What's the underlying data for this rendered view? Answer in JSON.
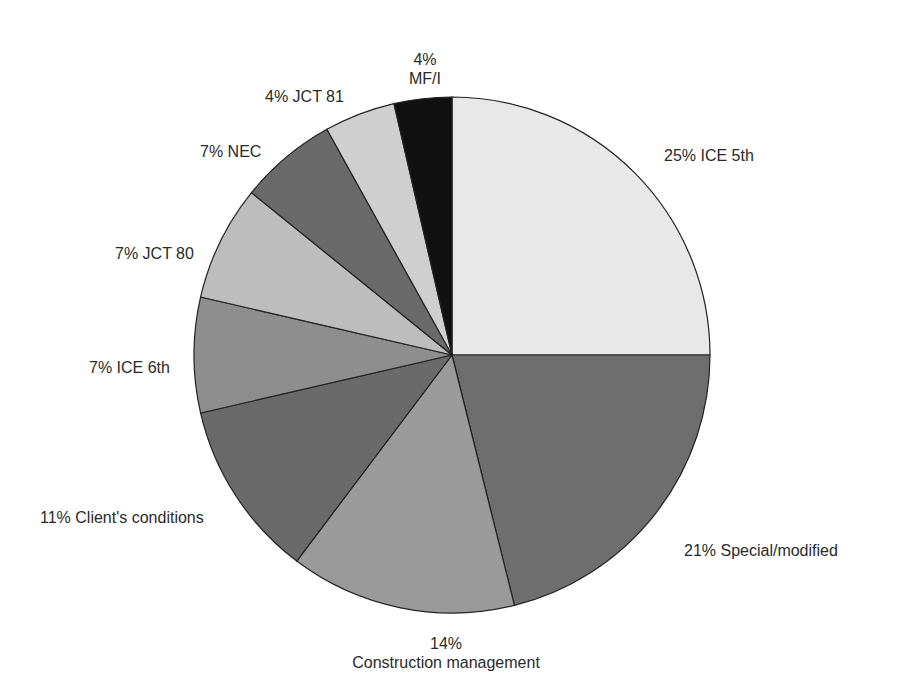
{
  "chart_data": {
    "type": "pie",
    "title": "",
    "start_angle": "12 o'clock",
    "direction": "clockwise",
    "slices": [
      {
        "label": "ICE 5th",
        "value": 25,
        "display": "25% ICE 5th",
        "color": "#e8e8e8",
        "start_deg": 0,
        "end_deg": 90
      },
      {
        "label": "Special/modified",
        "value": 21,
        "display": "21% Special/modified",
        "color": "#6e6e6e",
        "start_deg": 90,
        "end_deg": 166
      },
      {
        "label": "Construction management",
        "value": 14,
        "display": "14%\nConstruction management",
        "color": "#9a9a9a",
        "start_deg": 166,
        "end_deg": 217
      },
      {
        "label": "Client's conditions",
        "value": 11,
        "display": "11% Client's conditions",
        "color": "#6a6a6a",
        "start_deg": 217,
        "end_deg": 257
      },
      {
        "label": "ICE 6th",
        "value": 7,
        "display": "7% ICE 6th",
        "color": "#8e8e8e",
        "start_deg": 257,
        "end_deg": 283
      },
      {
        "label": "JCT 80",
        "value": 7,
        "display": "7% JCT 80",
        "color": "#bdbdbd",
        "start_deg": 283,
        "end_deg": 309
      },
      {
        "label": "NEC",
        "value": 7,
        "display": "7% NEC",
        "color": "#6a6a6a",
        "start_deg": 309,
        "end_deg": 331
      },
      {
        "label": "JCT 81",
        "value": 4,
        "display": "4% JCT 81",
        "color": "#cfcfcf",
        "start_deg": 331,
        "end_deg": 347
      },
      {
        "label": "MF/I",
        "value": 4,
        "display": "4%\nMF/I",
        "color": "#111111",
        "start_deg": 347,
        "end_deg": 360
      }
    ]
  },
  "labels": {
    "ice5": "25% ICE 5th",
    "special": "21% Special/modified",
    "cm_pct": "14%",
    "cm_name": "Construction management",
    "client": "11% Client's conditions",
    "ice6": "7% ICE 6th",
    "jct80": "7% JCT 80",
    "nec": "7% NEC",
    "jct81": "4% JCT 81",
    "mfi_pct": "4%",
    "mfi_name": "MF/I"
  }
}
